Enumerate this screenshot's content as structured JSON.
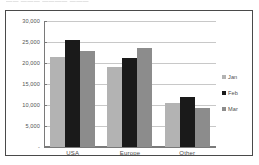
{
  "title_strip": {
    "text": "——  ———  ————  ———"
  },
  "legend": {
    "position": "right",
    "items": [
      {
        "label": "Jan",
        "color": "#b3b3b3"
      },
      {
        "label": "Feb",
        "color": "#1a1a1a"
      },
      {
        "label": "Mar",
        "color": "#8c8c8c"
      }
    ]
  },
  "axis": {
    "y_tick_labels": [
      "30,000",
      "25,000",
      "20,000",
      "15,000",
      "10,000",
      "5,000",
      "-"
    ],
    "x_tick_labels": [
      "USA",
      "Europe",
      "Other"
    ]
  },
  "colors": {
    "jan": "#b3b3b3",
    "feb": "#1a1a1a",
    "mar": "#8c8c8c",
    "gridline": "#c8c8c8",
    "axis": "#7a7a7a",
    "frame": "#4a4a4a",
    "text": "#4d4d4d",
    "background": "#ffffff"
  },
  "chart_data": {
    "type": "bar",
    "title": "",
    "xlabel": "",
    "ylabel": "",
    "categories": [
      "USA",
      "Europe",
      "Other"
    ],
    "series": [
      {
        "name": "Jan",
        "color": "#b3b3b3",
        "values": [
          21500,
          19100,
          10500
        ]
      },
      {
        "name": "Feb",
        "color": "#1a1a1a",
        "values": [
          25500,
          21300,
          12000
        ]
      },
      {
        "name": "Mar",
        "color": "#8c8c8c",
        "values": [
          22800,
          23600,
          9400
        ]
      }
    ],
    "ylim": [
      0,
      30000
    ],
    "ytick_values": [
      0,
      5000,
      10000,
      15000,
      20000,
      25000,
      30000
    ],
    "ytick_labels": [
      "-",
      "5,000",
      "10,000",
      "15,000",
      "20,000",
      "25,000",
      "30,000"
    ],
    "grid": true,
    "grid_axis": "y",
    "legend": true,
    "legend_position": "right",
    "bar_orientation": "vertical",
    "grouping": "clustered"
  }
}
